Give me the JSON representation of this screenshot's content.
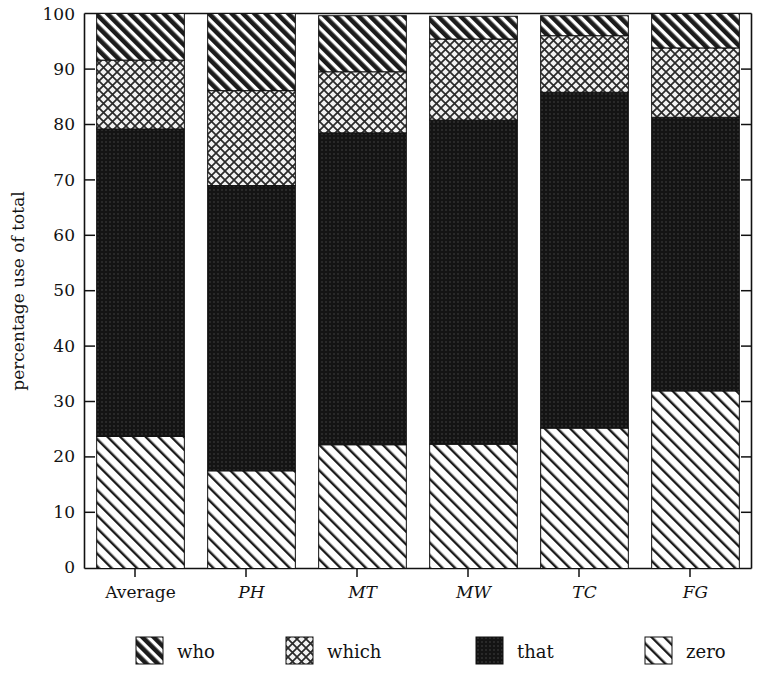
{
  "chart_data": {
    "type": "bar",
    "subtype": "stacked-bar-100",
    "title": "",
    "xlabel": "",
    "ylabel": "percentage use of total",
    "ylim": [
      0,
      100
    ],
    "yticks": [
      0,
      10,
      20,
      30,
      40,
      50,
      60,
      70,
      80,
      90,
      100
    ],
    "ytick_labels": [
      "0",
      "10",
      "20",
      "30",
      "40",
      "50",
      "60",
      "70",
      "80",
      "90",
      "100"
    ],
    "grid": false,
    "legend_position": "bottom",
    "categories": [
      "Average",
      "PH",
      "MT",
      "MW",
      "TC",
      "FG"
    ],
    "category_styles": [
      "normal",
      "italic",
      "italic",
      "italic",
      "italic",
      "italic"
    ],
    "stack_order_bottom_to_top": [
      "zero",
      "that",
      "which",
      "who"
    ],
    "series": [
      {
        "name": "zero",
        "pattern": "light-forward-slash-hatch",
        "color": "#ffffff",
        "values": [
          23.8,
          17.6,
          22.3,
          22.4,
          25.3,
          32.0
        ]
      },
      {
        "name": "that",
        "pattern": "dark-dotted-fill",
        "color": "#1a1a1a",
        "values": [
          55.4,
          51.4,
          56.2,
          58.4,
          60.5,
          49.3
        ]
      },
      {
        "name": "which",
        "pattern": "light-crosshatch",
        "color": "#efefef",
        "values": [
          12.4,
          17.1,
          11.0,
          14.6,
          10.2,
          12.5
        ]
      },
      {
        "name": "who",
        "pattern": "dense-forward-slash-hatch",
        "color": "#222222",
        "values": [
          8.4,
          13.9,
          10.1,
          4.1,
          3.6,
          6.1
        ]
      }
    ],
    "stack_boundaries": {
      "Average": {
        "zero_top": 23.8,
        "that_top": 79.2,
        "which_top": 91.6,
        "who_top": 100.0
      },
      "PH": {
        "zero_top": 17.6,
        "that_top": 69.0,
        "which_top": 86.1,
        "who_top": 100.0
      },
      "MT": {
        "zero_top": 22.3,
        "that_top": 78.5,
        "which_top": 89.5,
        "who_top": 99.6
      },
      "MW": {
        "zero_top": 22.4,
        "that_top": 80.8,
        "which_top": 95.4,
        "who_top": 99.5
      },
      "TC": {
        "zero_top": 25.3,
        "that_top": 85.8,
        "which_top": 96.0,
        "who_top": 99.6
      },
      "FG": {
        "zero_top": 32.0,
        "that_top": 81.3,
        "which_top": 93.8,
        "who_top": 100.0
      }
    }
  },
  "legend": {
    "items": [
      {
        "label": "who",
        "pattern": "dense-forward-slash-hatch"
      },
      {
        "label": "which",
        "pattern": "light-crosshatch"
      },
      {
        "label": "that",
        "pattern": "dark-dotted-fill"
      },
      {
        "label": "zero",
        "pattern": "light-forward-slash-hatch"
      }
    ]
  },
  "axis": {
    "y_title": "percentage use of total"
  }
}
